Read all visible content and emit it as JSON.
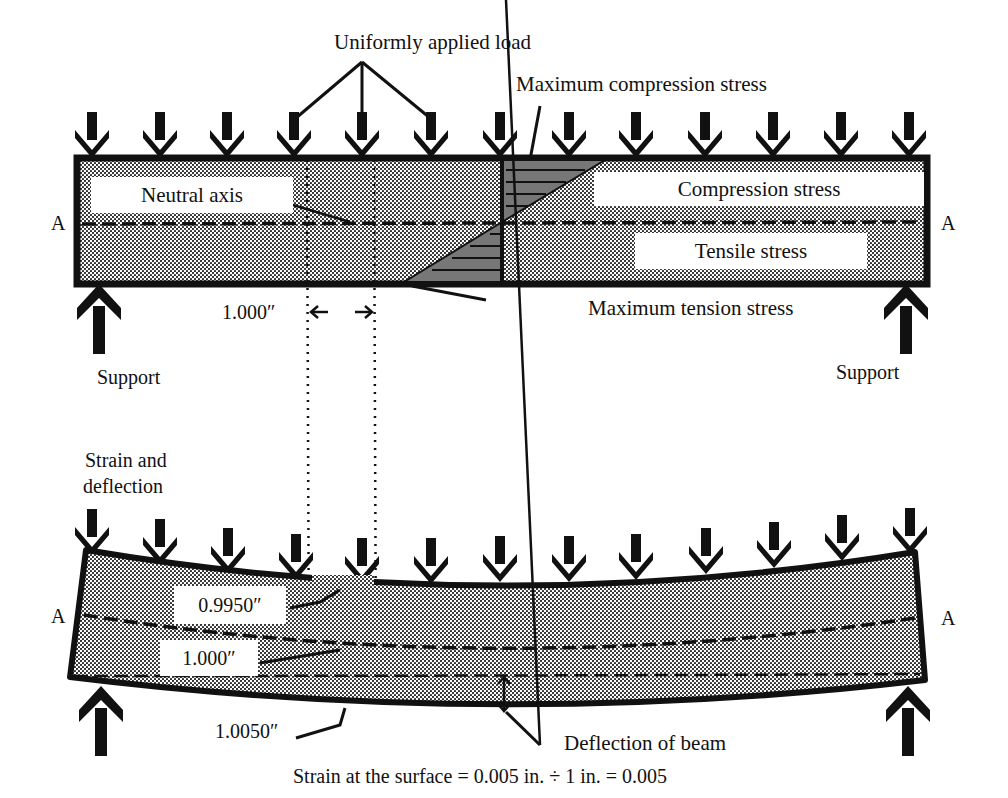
{
  "top_beam": {
    "load_label": "Uniformly applied load",
    "max_compression_label": "Maximum compression stress",
    "neutral_axis_label": "Neutral axis",
    "compression_label": "Compression stress",
    "tensile_label": "Tensile stress",
    "max_tension_label": "Maximum tension stress",
    "gauge_length_label": "1.000″",
    "section_left": "A",
    "section_right": "A",
    "support_left": "Support",
    "support_right": "Support"
  },
  "bottom_beam": {
    "title_line1": "Strain and",
    "title_line2": "deflection",
    "top_length_label": "0.9950″",
    "neutral_length_label": "1.000″",
    "bottom_length_label": "1.0050″",
    "deflection_label": "Deflection of beam",
    "section_left": "A",
    "section_right": "A"
  },
  "equation": "Strain at the surface = 0.005 in. ÷ 1 in. = 0.005",
  "colors": {
    "ink": "#111111",
    "fill": "#bdbdbd",
    "paper": "#ffffff"
  }
}
